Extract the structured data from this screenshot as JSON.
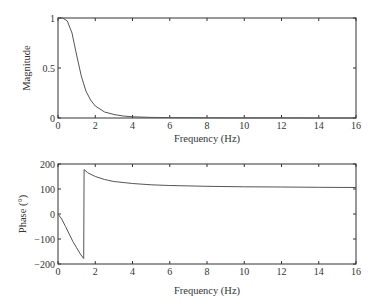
{
  "chart_data": [
    {
      "type": "line",
      "title": "",
      "xlabel": "Frequency (Hz)",
      "ylabel": "Magnitude",
      "xlim": [
        0,
        16
      ],
      "ylim": [
        0,
        1
      ],
      "xticks": [
        "0",
        "2",
        "4",
        "6",
        "8",
        "10",
        "12",
        "14",
        "16"
      ],
      "yticks": [
        "0",
        "0.5",
        "1"
      ],
      "grid": false,
      "legend": null,
      "series": [
        {
          "name": "Magnitude",
          "x": [
            0,
            0.25,
            0.5,
            0.75,
            1.0,
            1.25,
            1.5,
            1.75,
            2.0,
            2.5,
            3.0,
            3.5,
            4.0,
            5.0,
            6.0,
            8.0,
            10.0,
            12.0,
            14.0,
            16.0
          ],
          "y": [
            1.0,
            1.0,
            0.97,
            0.85,
            0.63,
            0.42,
            0.27,
            0.18,
            0.12,
            0.06,
            0.035,
            0.02,
            0.012,
            0.006,
            0.004,
            0.002,
            0.001,
            0.001,
            0.0,
            0.0
          ]
        }
      ]
    },
    {
      "type": "line",
      "title": "",
      "xlabel": "Frequency (Hz)",
      "ylabel": "Phase (°)",
      "xlim": [
        0,
        16
      ],
      "ylim": [
        -200,
        200
      ],
      "xticks": [
        "0",
        "2",
        "4",
        "6",
        "8",
        "10",
        "12",
        "14",
        "16"
      ],
      "yticks": [
        "-200",
        "-100",
        "0",
        "100",
        "200"
      ],
      "grid": false,
      "legend": null,
      "series": [
        {
          "name": "Phase",
          "x": [
            0,
            0.2,
            0.4,
            0.6,
            0.8,
            1.0,
            1.2,
            1.38,
            1.4,
            1.6,
            2.0,
            2.5,
            3.0,
            4.0,
            5.0,
            6.0,
            8.0,
            10.0,
            12.0,
            14.0,
            16.0
          ],
          "y": [
            0,
            -20,
            -50,
            -80,
            -110,
            -135,
            -160,
            -178,
            178,
            165,
            150,
            138,
            130,
            122,
            117,
            114,
            111,
            109,
            108,
            107,
            106
          ]
        }
      ]
    }
  ],
  "top_plot": {
    "ylabel": "Magnitude",
    "xlabel": "Frequency (Hz)",
    "yticks": [
      "0",
      "0.5",
      "1"
    ],
    "xticks": [
      "0",
      "2",
      "4",
      "6",
      "8",
      "10",
      "12",
      "14",
      "16"
    ]
  },
  "bottom_plot": {
    "ylabel": "Phase (°)",
    "xlabel": "Frequency (Hz)",
    "yticks": [
      "-200",
      "-100",
      "0",
      "100",
      "200"
    ],
    "xticks": [
      "0",
      "2",
      "4",
      "6",
      "8",
      "10",
      "12",
      "14",
      "16"
    ]
  },
  "colors": {
    "line": "#555555",
    "axes": "#333333",
    "background": "#ffffff"
  }
}
